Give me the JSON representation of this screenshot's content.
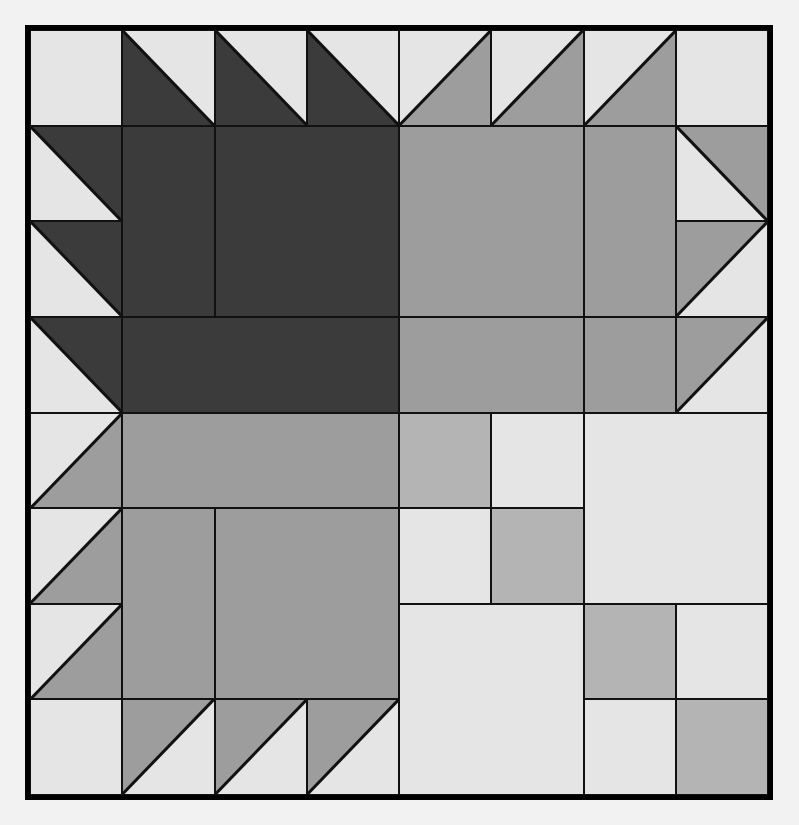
{
  "artwork": {
    "title": "Quilt Block Layout Diagram",
    "type": "patchwork-quilt-pattern",
    "grid": {
      "columns": 8,
      "rows": 8,
      "cell_size_px": 93
    },
    "palette": {
      "dark": "#3b3b3b",
      "medium": "#9d9d9d",
      "medium_light": "#b4b4b4",
      "light": "#e5e5e5",
      "background": "#f2f2f2",
      "line": "#111111"
    },
    "labels": [
      {
        "text": "E",
        "col": 1,
        "row": 1
      },
      {
        "text": "D",
        "col": 4,
        "row": 1
      },
      {
        "text": "D",
        "col": 6,
        "row": 1
      },
      {
        "text": "D",
        "col": 1,
        "row": 2
      },
      {
        "text": "C",
        "col": 5,
        "row": 2
      },
      {
        "text": "D",
        "col": 8,
        "row": 3
      },
      {
        "text": "D",
        "col": 1,
        "row": 4
      },
      {
        "text": "F",
        "col": 3,
        "row": 4
      },
      {
        "text": "E",
        "col": 7,
        "row": 4
      },
      {
        "text": "D",
        "col": 1,
        "row": 6
      },
      {
        "text": "F",
        "col": 2,
        "row": 6
      },
      {
        "text": "C",
        "col": 3,
        "row": 6
      },
      {
        "text": "E",
        "col": 5,
        "row": 6
      },
      {
        "text": "C",
        "col": 5,
        "row": 7
      },
      {
        "text": "E",
        "col": 7,
        "row": 7
      },
      {
        "text": "D",
        "col": 2,
        "row": 8
      }
    ],
    "pieces": [
      {
        "name": "r1c1-square-light",
        "col": 1,
        "row": 1,
        "w": 1,
        "h": 1,
        "shape": "square",
        "color": "light",
        "label": "E"
      },
      {
        "name": "r1c2-hst-dark",
        "col": 2,
        "row": 1,
        "w": 1,
        "h": 1,
        "shape": "triangle-bl",
        "color": "dark",
        "base": "light"
      },
      {
        "name": "r1c3-hst-dark",
        "col": 3,
        "row": 1,
        "w": 1,
        "h": 1,
        "shape": "triangle-bl",
        "color": "dark",
        "base": "light"
      },
      {
        "name": "r1c4-hst-dark",
        "col": 4,
        "row": 1,
        "w": 1,
        "h": 1,
        "shape": "triangle-bl",
        "color": "dark",
        "base": "light",
        "label": "D"
      },
      {
        "name": "r1c5-hst-medium",
        "col": 5,
        "row": 1,
        "w": 1,
        "h": 1,
        "shape": "triangle-br",
        "color": "medium",
        "base": "light"
      },
      {
        "name": "r1c6-hst-medium",
        "col": 6,
        "row": 1,
        "w": 1,
        "h": 1,
        "shape": "triangle-br",
        "color": "medium",
        "base": "light",
        "label": "D"
      },
      {
        "name": "r1c7-hst-medium",
        "col": 7,
        "row": 1,
        "w": 1,
        "h": 1,
        "shape": "triangle-br",
        "color": "medium",
        "base": "light"
      },
      {
        "name": "r1c8-square-light",
        "col": 8,
        "row": 1,
        "w": 1,
        "h": 1,
        "shape": "square",
        "color": "light"
      },
      {
        "name": "r2c1-hst-dark",
        "col": 1,
        "row": 2,
        "w": 1,
        "h": 1,
        "shape": "triangle-tr",
        "color": "dark",
        "base": "light",
        "label": "D"
      },
      {
        "name": "r2c2-rect-dark",
        "col": 2,
        "row": 2,
        "w": 1,
        "h": 2,
        "shape": "square",
        "color": "dark"
      },
      {
        "name": "r2c3-block-dark",
        "col": 3,
        "row": 2,
        "w": 2,
        "h": 2,
        "shape": "square",
        "color": "dark"
      },
      {
        "name": "r2c5-block-medium",
        "col": 5,
        "row": 2,
        "w": 2,
        "h": 2,
        "shape": "square",
        "color": "medium",
        "label": "C"
      },
      {
        "name": "r2c7-rect-medium",
        "col": 7,
        "row": 2,
        "w": 1,
        "h": 2,
        "shape": "square",
        "color": "medium"
      },
      {
        "name": "r2c8-hst-medium",
        "col": 8,
        "row": 2,
        "w": 1,
        "h": 1,
        "shape": "triangle-tr",
        "color": "medium",
        "base": "light"
      },
      {
        "name": "r3c1-hst-dark",
        "col": 1,
        "row": 3,
        "w": 1,
        "h": 1,
        "shape": "triangle-tr",
        "color": "dark",
        "base": "light"
      },
      {
        "name": "r3c8-hst-medium",
        "col": 8,
        "row": 3,
        "w": 1,
        "h": 1,
        "shape": "triangle-tl",
        "color": "medium",
        "base": "light",
        "label": "D"
      },
      {
        "name": "r4c1-hst-dark",
        "col": 1,
        "row": 4,
        "w": 1,
        "h": 1,
        "shape": "triangle-tr",
        "color": "dark",
        "base": "light",
        "label": "D"
      },
      {
        "name": "r4c2-block-dark",
        "col": 2,
        "row": 4,
        "w": 3,
        "h": 1,
        "shape": "square",
        "color": "dark",
        "label": "F"
      },
      {
        "name": "r4c5-rect-medium",
        "col": 5,
        "row": 4,
        "w": 2,
        "h": 1,
        "shape": "square",
        "color": "medium"
      },
      {
        "name": "r4c7-square-medium",
        "col": 7,
        "row": 4,
        "w": 1,
        "h": 1,
        "shape": "square",
        "color": "medium",
        "label": "E"
      },
      {
        "name": "r4c8-hst-medium",
        "col": 8,
        "row": 4,
        "w": 1,
        "h": 1,
        "shape": "triangle-tl",
        "color": "medium",
        "base": "light"
      },
      {
        "name": "r5c1-hst-medium",
        "col": 1,
        "row": 5,
        "w": 1,
        "h": 1,
        "shape": "triangle-br",
        "color": "medium",
        "base": "light"
      },
      {
        "name": "r5c2-rect-medium",
        "col": 2,
        "row": 5,
        "w": 3,
        "h": 1,
        "shape": "square",
        "color": "medium"
      },
      {
        "name": "r5c5-square-medium-light",
        "col": 5,
        "row": 5,
        "w": 1,
        "h": 1,
        "shape": "square",
        "color": "medium_light"
      },
      {
        "name": "r5c6-square-light",
        "col": 6,
        "row": 5,
        "w": 1,
        "h": 1,
        "shape": "square",
        "color": "light"
      },
      {
        "name": "r5c7-block-light",
        "col": 7,
        "row": 5,
        "w": 2,
        "h": 2,
        "shape": "square",
        "color": "light"
      },
      {
        "name": "r6c1-hst-medium",
        "col": 1,
        "row": 6,
        "w": 1,
        "h": 1,
        "shape": "triangle-br",
        "color": "medium",
        "base": "light",
        "label": "D"
      },
      {
        "name": "r6c2-rect-medium",
        "col": 2,
        "row": 6,
        "w": 1,
        "h": 2,
        "shape": "square",
        "color": "medium",
        "label": "F"
      },
      {
        "name": "r6c3-block-medium",
        "col": 3,
        "row": 6,
        "w": 2,
        "h": 2,
        "shape": "square",
        "color": "medium",
        "label": "C"
      },
      {
        "name": "r6c5-square-light",
        "col": 5,
        "row": 6,
        "w": 1,
        "h": 1,
        "shape": "square",
        "color": "light",
        "label": "E"
      },
      {
        "name": "r6c6-square-medium-light",
        "col": 6,
        "row": 6,
        "w": 1,
        "h": 1,
        "shape": "square",
        "color": "medium_light"
      },
      {
        "name": "r7c1-hst-medium",
        "col": 1,
        "row": 7,
        "w": 1,
        "h": 1,
        "shape": "triangle-br",
        "color": "medium",
        "base": "light"
      },
      {
        "name": "r7c5-block-light",
        "col": 5,
        "row": 7,
        "w": 2,
        "h": 2,
        "shape": "square",
        "color": "light",
        "label": "C"
      },
      {
        "name": "r7c7-square-medium-light",
        "col": 7,
        "row": 7,
        "w": 1,
        "h": 1,
        "shape": "square",
        "color": "medium_light",
        "label": "E"
      },
      {
        "name": "r7c8-square-light",
        "col": 8,
        "row": 7,
        "w": 1,
        "h": 1,
        "shape": "square",
        "color": "light"
      },
      {
        "name": "r8c1-square-light",
        "col": 1,
        "row": 8,
        "w": 1,
        "h": 1,
        "shape": "square",
        "color": "light"
      },
      {
        "name": "r8c2-hst-medium",
        "col": 2,
        "row": 8,
        "w": 1,
        "h": 1,
        "shape": "triangle-tl",
        "color": "medium",
        "base": "light",
        "label": "D"
      },
      {
        "name": "r8c3-hst-medium",
        "col": 3,
        "row": 8,
        "w": 1,
        "h": 1,
        "shape": "triangle-tl",
        "color": "medium",
        "base": "light"
      },
      {
        "name": "r8c4-hst-medium",
        "col": 4,
        "row": 8,
        "w": 1,
        "h": 1,
        "shape": "triangle-tl",
        "color": "medium",
        "base": "light"
      },
      {
        "name": "r8c7-square-light",
        "col": 7,
        "row": 8,
        "w": 1,
        "h": 1,
        "shape": "square",
        "color": "light"
      },
      {
        "name": "r8c8-square-medium-light",
        "col": 8,
        "row": 8,
        "w": 1,
        "h": 1,
        "shape": "square",
        "color": "medium_light"
      }
    ]
  }
}
